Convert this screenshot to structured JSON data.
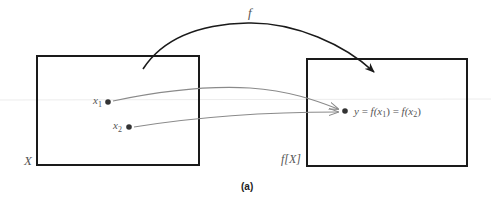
{
  "figure": {
    "caption": "(a)",
    "function_label": "f",
    "domain_set": {
      "label": "X",
      "rect": {
        "x": 37,
        "y": 56,
        "width": 162,
        "height": 109
      }
    },
    "image_set": {
      "label": "f[X]",
      "rect": {
        "x": 307,
        "y": 59,
        "width": 160,
        "height": 107
      }
    },
    "points": [
      {
        "name": "x1",
        "label_base": "x",
        "label_sub": "1",
        "cx": 108,
        "cy": 102
      },
      {
        "name": "x2",
        "label_base": "x",
        "label_sub": "2",
        "cx": 129,
        "cy": 127
      },
      {
        "name": "y",
        "cx": 345,
        "cy": 111
      }
    ],
    "equation": {
      "lhs": "y",
      "eq": "=",
      "f1": "f(x",
      "sub1": "1",
      "close1": ")",
      "eq2": "=",
      "f2": "f(x",
      "sub2": "2",
      "close2": ")"
    },
    "colors": {
      "box_stroke": "#1a1a1a",
      "main_arrow": "#1a1a1a",
      "mapping_arrows": "#8a8a8a",
      "points": "#333333",
      "text": "#555555"
    }
  }
}
